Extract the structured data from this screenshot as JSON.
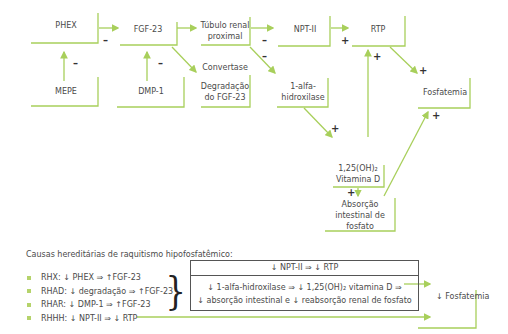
{
  "diagram": {
    "nodes": {
      "phex": "PHEX",
      "mepe": "MEPE",
      "fgf23": "FGF-23",
      "dmp1": "DMP-1",
      "tubulo_1": "Túbulo renal",
      "tubulo_2": "proximal",
      "convertase": "Convertase",
      "degradacao_1": "Degradação",
      "degradacao_2": "do FGF-23",
      "npt2": "NPT-II",
      "rtp": "RTP",
      "alfa_1": "1-alfa-",
      "alfa_2": "hidroxilase",
      "vitd_1": "1,25(OH)₂",
      "vitd_2": "Vitamina D",
      "absorcao_1": "Absorção",
      "absorcao_2": "intestinal de",
      "absorcao_3": "fosfato",
      "fosfatemia": "Fosfatemia"
    },
    "signs": {
      "minus": "–",
      "plus": "+"
    },
    "accent_color": "#a8cf5b"
  },
  "legend": {
    "caption": "Causas hereditárias de raquitismo hipofosfatêmico:",
    "items": [
      "RHX: ↓ PHEX ⇒ ↑FGF-23",
      "RHAD: ↓ degradação ⇒ ↑FGF-23",
      "RHAR: ↓ DMP-1 ⇒ ↑FGF-23",
      "RHHH: ↓ NPT-II ⇒ ↓ RTP"
    ],
    "brace": "}",
    "summary_top": "↓ NPT-II ⇒ ↓ RTP",
    "summary_line1": "↓ 1-alfa-hidroxilase ⇒ ↓ 1,25(OH)₂ vitamina D ⇒",
    "summary_line2": "↓ absorção intestinal e ↓ reabsorção renal de fosfato",
    "result": "↓ Fosfatemia"
  }
}
